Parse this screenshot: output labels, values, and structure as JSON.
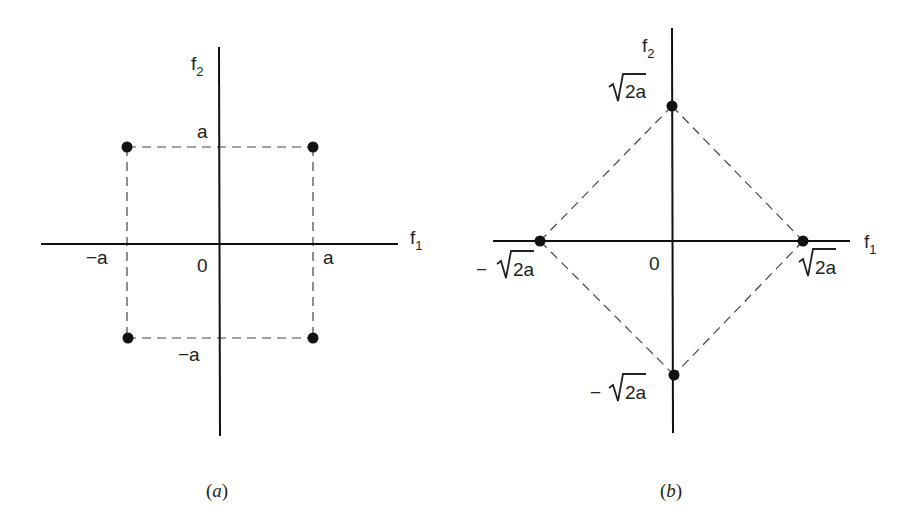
{
  "figure": {
    "panel_a": {
      "caption": "a",
      "axis_x_label": "f",
      "axis_x_sub": "1",
      "axis_y_label": "f",
      "axis_y_sub": "2",
      "origin_label": "0",
      "tick_pos_x": "a",
      "tick_neg_x": "−a",
      "tick_pos_y": "a",
      "tick_neg_y": "−a",
      "points": [
        {
          "f1": "a",
          "f2": "a"
        },
        {
          "f1": "-a",
          "f2": "a"
        },
        {
          "f1": "-a",
          "f2": "-a"
        },
        {
          "f1": "a",
          "f2": "-a"
        }
      ],
      "shape": "square (dashed)"
    },
    "panel_b": {
      "caption": "b",
      "axis_x_label": "f",
      "axis_x_sub": "1",
      "axis_y_label": "f",
      "axis_y_sub": "2",
      "origin_label": "0",
      "tick_pos_x": "2a",
      "tick_neg_x": "2a",
      "tick_pos_y": "2a",
      "tick_neg_y": "2a",
      "minus": "−",
      "radical": "√",
      "points": [
        {
          "f1": "0",
          "f2": "√2a"
        },
        {
          "f1": "√2a",
          "f2": "0"
        },
        {
          "f1": "0",
          "f2": "-√2a"
        },
        {
          "f1": "-√2a",
          "f2": "0"
        }
      ],
      "shape": "diamond (dashed)"
    },
    "paren_open": "(",
    "paren_close": ")"
  },
  "colors": {
    "ink": "#111111",
    "dash": "#444444",
    "background": "#ffffff"
  }
}
